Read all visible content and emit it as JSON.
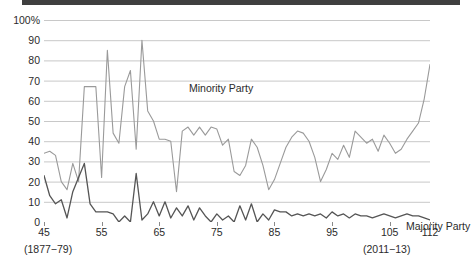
{
  "chart_data": {
    "type": "line",
    "title": "",
    "subtitle": "",
    "xlabel": "",
    "ylabel": "",
    "ylim": [
      0,
      100
    ],
    "xlim": [
      45,
      112
    ],
    "grid": true,
    "legend": "inline-annotations",
    "y_ticks": [
      "0",
      "10",
      "20",
      "30",
      "40",
      "50",
      "60",
      "70",
      "80",
      "90",
      "100%"
    ],
    "y_tick_values": [
      0,
      10,
      20,
      30,
      40,
      50,
      60,
      70,
      80,
      90,
      100
    ],
    "x_ticks": [
      "45",
      "55",
      "65",
      "75",
      "85",
      "95",
      "105",
      "112"
    ],
    "x_tick_values": [
      45,
      55,
      65,
      75,
      85,
      95,
      105,
      112
    ],
    "annotations": [
      {
        "text": "(1877−79)",
        "position": "below-left-axis"
      },
      {
        "text": "(2011−13)",
        "position": "below-right-axis"
      }
    ],
    "x": [
      45,
      46,
      47,
      48,
      49,
      50,
      51,
      52,
      53,
      54,
      55,
      56,
      57,
      58,
      59,
      60,
      61,
      62,
      63,
      64,
      65,
      66,
      67,
      68,
      69,
      70,
      71,
      72,
      73,
      74,
      75,
      76,
      77,
      78,
      79,
      80,
      81,
      82,
      83,
      84,
      85,
      86,
      87,
      88,
      89,
      90,
      91,
      92,
      93,
      94,
      95,
      96,
      97,
      98,
      99,
      100,
      101,
      102,
      103,
      104,
      105,
      106,
      107,
      108,
      109,
      110,
      111,
      112
    ],
    "series": [
      {
        "name": "Minority Party",
        "color": "#9a9a9a",
        "values": [
          34,
          35,
          33,
          20,
          16,
          29,
          20,
          67,
          67,
          67,
          22,
          85,
          44,
          39,
          67,
          75,
          36,
          90,
          55,
          50,
          41,
          41,
          40,
          15,
          45,
          47,
          43,
          47,
          43,
          47,
          46,
          38,
          41,
          25,
          23,
          28,
          41,
          37,
          28,
          16,
          21,
          29,
          37,
          42,
          45,
          44,
          40,
          32,
          20,
          26,
          34,
          31,
          38,
          32,
          45,
          42,
          39,
          41,
          35,
          43,
          39,
          34,
          36,
          41,
          45,
          49,
          61,
          78
        ]
      },
      {
        "name": "Majority Party",
        "color": "#555555",
        "values": [
          23,
          13,
          9,
          11,
          2,
          15,
          22,
          29,
          9,
          5,
          5,
          5,
          4,
          0,
          3,
          0,
          24,
          1,
          4,
          10,
          3,
          10,
          2,
          7,
          3,
          8,
          1,
          7,
          3,
          0,
          4,
          1,
          3,
          0,
          8,
          1,
          9,
          0,
          4,
          1,
          6,
          5,
          5,
          3,
          4,
          3,
          4,
          3,
          4,
          2,
          5,
          3,
          4,
          2,
          4,
          3,
          3,
          2,
          3,
          4,
          3,
          2,
          3,
          4,
          3,
          3,
          2,
          1
        ]
      }
    ]
  },
  "labels": {
    "minority": "Minority Party",
    "majority": "Majority Party",
    "note_left": "(1877−79)",
    "note_right": "(2011−13)"
  },
  "colors": {
    "minority_line": "#9a9a9a",
    "majority_line": "#555555",
    "gridline": "#c8c8c8",
    "axis": "#8a8a8a",
    "top_rule": "#3f3f3f",
    "text": "#2b2b2b",
    "background": "#ffffff"
  }
}
